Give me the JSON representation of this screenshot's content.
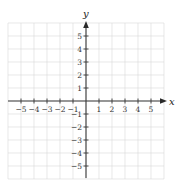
{
  "chart_data": {
    "type": "scatter",
    "title": "",
    "xlabel": "x",
    "ylabel": "y",
    "xlim": [
      -6,
      6
    ],
    "ylim": [
      -6,
      6
    ],
    "grid": true,
    "x_ticks": [
      -5,
      -4,
      -3,
      -2,
      -1,
      1,
      2,
      3,
      4,
      5
    ],
    "y_ticks": [
      -5,
      -4,
      -3,
      -2,
      -1,
      1,
      2,
      3,
      4,
      5
    ],
    "x_tick_labels": [
      "−5",
      "−4",
      "−3",
      "−2",
      "−1",
      "1",
      "2",
      "3",
      "4",
      "5"
    ],
    "y_tick_labels": [
      "−5",
      "−4",
      "−3",
      "−2",
      "−1",
      "1",
      "2",
      "3",
      "4",
      "5"
    ],
    "series": [],
    "legend": null
  },
  "axes": {
    "x_label": "x",
    "y_label": "y"
  },
  "colors": {
    "grid": "#d9d9d9",
    "axis": "#3a3a3a",
    "text": "#333333"
  }
}
